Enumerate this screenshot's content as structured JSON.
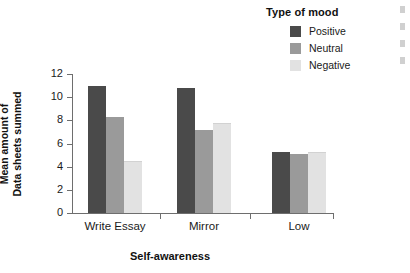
{
  "chart_data": {
    "type": "bar",
    "title": "",
    "xlabel": "Self-awareness",
    "ylabel": "Mean amount of\nData sheets summed",
    "ylabel_line1": "Mean amount of",
    "ylabel_line2": "Data sheets summed",
    "categories": [
      "Write Essay",
      "Mirror",
      "Low"
    ],
    "legend_title": "Type of mood",
    "legend_position": "top-right",
    "grid": false,
    "ylim": [
      0,
      12
    ],
    "yticks": [
      0,
      2,
      4,
      6,
      8,
      10,
      12
    ],
    "ytick_labels": [
      "0",
      "2",
      "4",
      "6",
      "8",
      "10",
      "12"
    ],
    "series": [
      {
        "name": "Positive",
        "color": "#4a4a4a",
        "values": [
          11.0,
          10.8,
          5.3
        ]
      },
      {
        "name": "Neutral",
        "color": "#9a9a9a",
        "values": [
          8.3,
          7.2,
          5.1
        ]
      },
      {
        "name": "Negative",
        "color": "#e2e2e2",
        "values": [
          4.4,
          7.7,
          5.2
        ]
      }
    ]
  },
  "legend": {
    "title": "Type of mood",
    "items": [
      {
        "label": "Positive",
        "color": "#4a4a4a"
      },
      {
        "label": "Neutral",
        "color": "#9a9a9a"
      },
      {
        "label": "Negative",
        "color": "#e2e2e2"
      }
    ]
  },
  "axes": {
    "x_title": "Self-awareness",
    "y_title_line1": "Mean amount of",
    "y_title_line2": "Data sheets summed",
    "y_ticks": [
      "12",
      "10",
      "8",
      "6",
      "4",
      "2",
      "0"
    ],
    "x_ticks": [
      "Write Essay",
      "Mirror",
      "Low"
    ]
  },
  "edge_artifact": {
    "marks": [
      "",
      "",
      "",
      ""
    ]
  }
}
